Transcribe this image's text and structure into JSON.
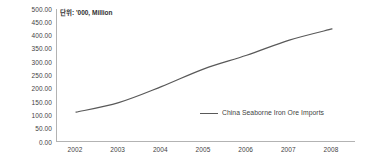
{
  "chart_data": {
    "type": "line",
    "title": "",
    "subtitle": "",
    "annotation": "단위: '000, Million",
    "xlabel": "",
    "ylabel": "",
    "categories": [
      "2002",
      "2003",
      "2004",
      "2005",
      "2006",
      "2007",
      "2008"
    ],
    "series": [
      {
        "name": "China Seaborne Iron Ore Imports",
        "color": "#595959",
        "values": [
          112,
          148,
          208,
          275,
          326,
          383,
          425
        ]
      }
    ],
    "ylim": [
      0,
      500
    ],
    "ytick_step": 50,
    "ytick_labels": [
      "500.00",
      "450.00",
      "400.00",
      "350.00",
      "300.00",
      "250.00",
      "200.00",
      "150.00",
      "100.00",
      "50.00",
      "0.00"
    ],
    "ytick_values": [
      500,
      450,
      400,
      350,
      300,
      250,
      200,
      150,
      100,
      50,
      0
    ],
    "grid": false,
    "legend_position": "inside-right",
    "axis_color": "#b3b3b3",
    "text_color": "#3f3f3f"
  }
}
